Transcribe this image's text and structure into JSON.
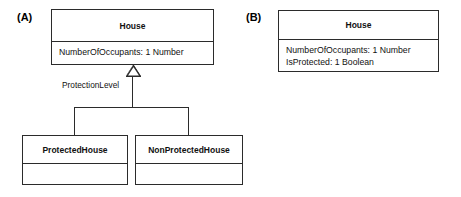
{
  "diagram": {
    "type": "uml-class-diagram",
    "background_color": "#ffffff",
    "line_color": "#2b2b2b",
    "text_color": "#111111",
    "panels": [
      {
        "label": "(A)",
        "superclass": {
          "name": "House",
          "attributes": [
            "NumberOfOccupants: 1 Number"
          ]
        },
        "relationship": {
          "kind": "generalization",
          "label": "ProtectionLevel",
          "arrowhead": "hollow-triangle"
        },
        "subclasses": [
          {
            "name": "ProtectedHouse",
            "attributes": []
          },
          {
            "name": "NonProtectedHouse",
            "attributes": []
          }
        ]
      },
      {
        "label": "(B)",
        "superclass": {
          "name": "House",
          "attributes": [
            "NumberOfOccupants: 1 Number",
            "IsProtected: 1 Boolean"
          ]
        }
      }
    ]
  }
}
